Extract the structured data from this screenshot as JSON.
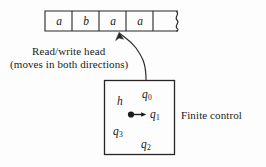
{
  "figure": {
    "stroke_color": "#262626",
    "background_color": "#fdfdfd"
  },
  "tape": {
    "name": "machine-tape",
    "cells": [
      {
        "symbol": "a"
      },
      {
        "symbol": "b"
      },
      {
        "symbol": "a"
      },
      {
        "symbol": "a"
      },
      {
        "symbol": ""
      }
    ],
    "continues_right": true
  },
  "annotation": {
    "line1": "Read/write head",
    "line2": "(moves in both directions)",
    "points_to_cell_index": 2
  },
  "finite_control": {
    "label": "Finite control",
    "states": [
      {
        "id": "h",
        "base": "h",
        "sub": ""
      },
      {
        "id": "q0",
        "base": "q",
        "sub": "0"
      },
      {
        "id": "q1",
        "base": "q",
        "sub": "1"
      },
      {
        "id": "q2",
        "base": "q",
        "sub": "2"
      },
      {
        "id": "q3",
        "base": "q",
        "sub": "3"
      }
    ],
    "current_state": "q1",
    "pointer": "dot-arrow-to-q1"
  }
}
